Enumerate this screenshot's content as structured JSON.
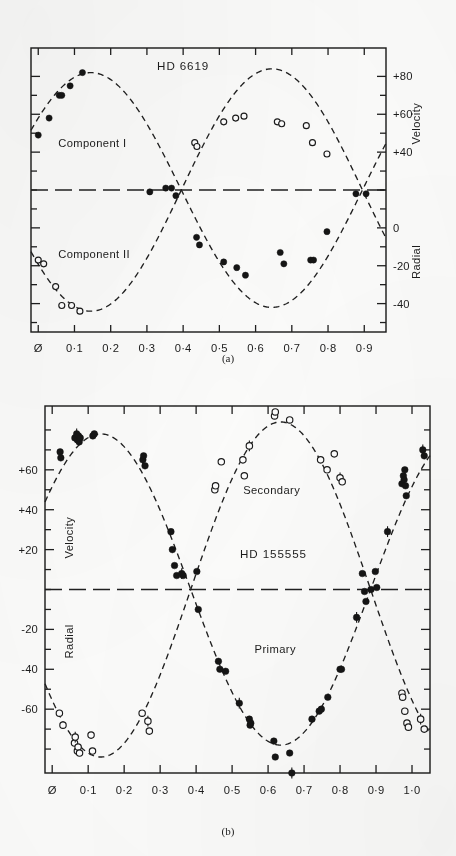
{
  "document": {
    "kind": "scientific-figure",
    "description": "Radial velocity curves for two spectroscopic binary systems"
  },
  "panels": [
    {
      "id": "a",
      "caption": "(a)",
      "title": "HD 6619",
      "xaxis": {
        "label": "",
        "ticks": [
          "Ø",
          "0·1",
          "0·2",
          "0·3",
          "0·4",
          "0·5",
          "0·6",
          "0·7",
          "0·8",
          "0·9"
        ],
        "tick_values": [
          0.0,
          0.1,
          0.2,
          0.3,
          0.4,
          0.5,
          0.6,
          0.7,
          0.8,
          0.9
        ],
        "range": [
          -0.02,
          0.96
        ]
      },
      "yaxis": {
        "title_upper": "Velocity",
        "title_lower": "Radial",
        "side": "right",
        "ticks": [
          "+80",
          "+60",
          "+40",
          "0",
          "-20",
          "-40"
        ],
        "tick_values": [
          80,
          60,
          40,
          0,
          -20,
          -40
        ],
        "minor_tick_values": [
          70,
          50,
          30,
          20,
          10,
          -10,
          -30,
          -50
        ],
        "range": [
          -55,
          95
        ],
        "gamma_velocity": 20
      },
      "series": [
        {
          "name": "Component I",
          "marker": "filled-circle",
          "label": "Component I",
          "label_pos": [
            0.055,
            45
          ],
          "points": [
            {
              "x": 0.0,
              "y": 49
            },
            {
              "x": 0.03,
              "y": 58
            },
            {
              "x": 0.058,
              "y": 70
            },
            {
              "x": 0.065,
              "y": 70
            },
            {
              "x": 0.088,
              "y": 75
            },
            {
              "x": 0.122,
              "y": 82
            },
            {
              "x": 0.308,
              "y": 19
            },
            {
              "x": 0.352,
              "y": 21
            },
            {
              "x": 0.368,
              "y": 21
            },
            {
              "x": 0.38,
              "y": 17
            },
            {
              "x": 0.437,
              "y": -5
            },
            {
              "x": 0.445,
              "y": -9
            },
            {
              "x": 0.512,
              "y": -18
            },
            {
              "x": 0.548,
              "y": -21
            },
            {
              "x": 0.572,
              "y": -25
            },
            {
              "x": 0.668,
              "y": -13
            },
            {
              "x": 0.678,
              "y": -19
            },
            {
              "x": 0.752,
              "y": -17
            },
            {
              "x": 0.76,
              "y": -17
            },
            {
              "x": 0.797,
              "y": -2
            },
            {
              "x": 0.877,
              "y": 18
            },
            {
              "x": 0.905,
              "y": 18
            }
          ],
          "curve": {
            "gamma": 20,
            "amplitude": 62,
            "phase_max": 0.145
          }
        },
        {
          "name": "Component II",
          "marker": "open-circle",
          "label": "Component II",
          "label_pos": [
            0.055,
            -14
          ],
          "points": [
            {
              "x": 0.0,
              "y": -17
            },
            {
              "x": 0.015,
              "y": -19
            },
            {
              "x": 0.048,
              "y": -31
            },
            {
              "x": 0.065,
              "y": -41
            },
            {
              "x": 0.092,
              "y": -41
            },
            {
              "x": 0.115,
              "y": -44
            },
            {
              "x": 0.432,
              "y": 45
            },
            {
              "x": 0.438,
              "y": 43
            },
            {
              "x": 0.512,
              "y": 56
            },
            {
              "x": 0.545,
              "y": 58
            },
            {
              "x": 0.568,
              "y": 59
            },
            {
              "x": 0.66,
              "y": 56
            },
            {
              "x": 0.672,
              "y": 55
            },
            {
              "x": 0.74,
              "y": 54
            },
            {
              "x": 0.757,
              "y": 45
            },
            {
              "x": 0.797,
              "y": 39
            }
          ],
          "curve": {
            "gamma": 20,
            "amplitude": -64,
            "phase_max": 0.145
          }
        }
      ]
    },
    {
      "id": "b",
      "caption": "(b)",
      "title": "HD 155555",
      "xaxis": {
        "label": "",
        "ticks": [
          "Ø",
          "0·1",
          "0·2",
          "0·3",
          "0·4",
          "0·5",
          "0·6",
          "0·7",
          "0·8",
          "0·9",
          "1·0"
        ],
        "tick_values": [
          0.0,
          0.1,
          0.2,
          0.3,
          0.4,
          0.5,
          0.6,
          0.7,
          0.8,
          0.9,
          1.0
        ],
        "range": [
          -0.02,
          1.05
        ]
      },
      "yaxis": {
        "title_upper": "Velocity",
        "title_lower": "Radial",
        "side": "left",
        "ticks": [
          "+60",
          "+40",
          "+20",
          "-20",
          "-40",
          "-60"
        ],
        "tick_values": [
          60,
          40,
          20,
          -20,
          -40,
          -60
        ],
        "minor_tick_values": [
          80,
          70,
          50,
          30,
          10,
          0,
          -10,
          -30,
          -50,
          -70,
          -80
        ],
        "range": [
          -92,
          92
        ],
        "gamma_velocity": 0
      },
      "series": [
        {
          "name": "Primary",
          "marker": "filled-circle",
          "label": "Primary",
          "label_pos": [
            0.62,
            -30
          ],
          "points": [
            {
              "x": 0.022,
              "y": 69
            },
            {
              "x": 0.024,
              "y": 66
            },
            {
              "x": 0.063,
              "y": 76
            },
            {
              "x": 0.068,
              "y": 78
            },
            {
              "x": 0.07,
              "y": 75
            },
            {
              "x": 0.073,
              "y": 77
            },
            {
              "x": 0.075,
              "y": 74
            },
            {
              "x": 0.078,
              "y": 76
            },
            {
              "x": 0.113,
              "y": 77
            },
            {
              "x": 0.117,
              "y": 78
            },
            {
              "x": 0.252,
              "y": 65
            },
            {
              "x": 0.254,
              "y": 67
            },
            {
              "x": 0.258,
              "y": 62
            },
            {
              "x": 0.33,
              "y": 29
            },
            {
              "x": 0.334,
              "y": 20
            },
            {
              "x": 0.34,
              "y": 12
            },
            {
              "x": 0.346,
              "y": 7
            },
            {
              "x": 0.36,
              "y": 8
            },
            {
              "x": 0.364,
              "y": 7
            },
            {
              "x": 0.402,
              "y": 9
            },
            {
              "x": 0.406,
              "y": -10
            },
            {
              "x": 0.462,
              "y": -36
            },
            {
              "x": 0.466,
              "y": -40
            },
            {
              "x": 0.482,
              "y": -41
            },
            {
              "x": 0.52,
              "y": -57
            },
            {
              "x": 0.548,
              "y": -65
            },
            {
              "x": 0.55,
              "y": -68
            },
            {
              "x": 0.552,
              "y": -67
            },
            {
              "x": 0.616,
              "y": -76
            },
            {
              "x": 0.62,
              "y": -84
            },
            {
              "x": 0.66,
              "y": -82
            },
            {
              "x": 0.666,
              "y": -92
            },
            {
              "x": 0.722,
              "y": -65
            },
            {
              "x": 0.742,
              "y": -61
            },
            {
              "x": 0.748,
              "y": -60
            },
            {
              "x": 0.766,
              "y": -54
            },
            {
              "x": 0.8,
              "y": -40
            },
            {
              "x": 0.804,
              "y": -40
            },
            {
              "x": 0.846,
              "y": -14
            },
            {
              "x": 0.862,
              "y": 8
            },
            {
              "x": 0.868,
              "y": -1
            },
            {
              "x": 0.872,
              "y": -6
            },
            {
              "x": 0.886,
              "y": 0
            },
            {
              "x": 0.898,
              "y": 9
            },
            {
              "x": 0.902,
              "y": 1
            },
            {
              "x": 0.932,
              "y": 29
            },
            {
              "x": 0.972,
              "y": 53
            },
            {
              "x": 0.976,
              "y": 57
            },
            {
              "x": 0.978,
              "y": 55
            },
            {
              "x": 0.98,
              "y": 60
            },
            {
              "x": 0.982,
              "y": 52
            },
            {
              "x": 0.984,
              "y": 47
            },
            {
              "x": 1.03,
              "y": 70
            },
            {
              "x": 1.034,
              "y": 67
            }
          ],
          "curve": {
            "gamma": 0,
            "amplitude": 78,
            "phase_max": 0.135
          }
        },
        {
          "name": "Secondary",
          "marker": "open-circle",
          "label": "Secondary",
          "label_pos": [
            0.61,
            50
          ],
          "points": [
            {
              "x": 0.02,
              "y": -62
            },
            {
              "x": 0.03,
              "y": -68
            },
            {
              "x": 0.062,
              "y": -77
            },
            {
              "x": 0.064,
              "y": -74
            },
            {
              "x": 0.07,
              "y": -81
            },
            {
              "x": 0.072,
              "y": -79
            },
            {
              "x": 0.076,
              "y": -82
            },
            {
              "x": 0.108,
              "y": -73
            },
            {
              "x": 0.112,
              "y": -81
            },
            {
              "x": 0.25,
              "y": -62
            },
            {
              "x": 0.266,
              "y": -66
            },
            {
              "x": 0.27,
              "y": -71
            },
            {
              "x": 0.452,
              "y": 50
            },
            {
              "x": 0.454,
              "y": 52
            },
            {
              "x": 0.47,
              "y": 64
            },
            {
              "x": 0.53,
              "y": 65
            },
            {
              "x": 0.534,
              "y": 57
            },
            {
              "x": 0.548,
              "y": 72
            },
            {
              "x": 0.618,
              "y": 87
            },
            {
              "x": 0.62,
              "y": 89
            },
            {
              "x": 0.66,
              "y": 85
            },
            {
              "x": 0.746,
              "y": 65
            },
            {
              "x": 0.764,
              "y": 60
            },
            {
              "x": 0.784,
              "y": 68
            },
            {
              "x": 0.8,
              "y": 56
            },
            {
              "x": 0.806,
              "y": 54
            },
            {
              "x": 0.972,
              "y": -52
            },
            {
              "x": 0.974,
              "y": -54
            },
            {
              "x": 0.98,
              "y": -61
            },
            {
              "x": 0.986,
              "y": -67
            },
            {
              "x": 0.99,
              "y": -69
            },
            {
              "x": 1.024,
              "y": -65
            },
            {
              "x": 1.034,
              "y": -70
            }
          ],
          "curve": {
            "gamma": 0,
            "amplitude": -84,
            "phase_max": 0.135
          }
        }
      ]
    }
  ]
}
